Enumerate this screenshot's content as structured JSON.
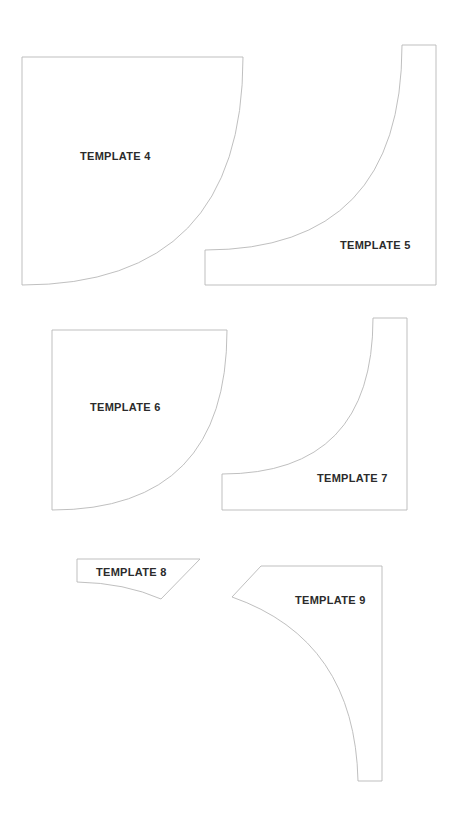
{
  "templates": [
    {
      "id": "4",
      "label": "TEMPLATE 4",
      "shape": "quarter-circle"
    },
    {
      "id": "5",
      "label": "TEMPLATE 5",
      "shape": "concave-corner"
    },
    {
      "id": "6",
      "label": "TEMPLATE 6",
      "shape": "quarter-circle"
    },
    {
      "id": "7",
      "label": "TEMPLATE 7",
      "shape": "concave-corner"
    },
    {
      "id": "8",
      "label": "TEMPLATE 8",
      "shape": "trapezoid-curved"
    },
    {
      "id": "9",
      "label": "TEMPLATE 9",
      "shape": "curved-wedge"
    }
  ],
  "colors": {
    "outline": "#b8b8b8",
    "text": "#2b2b2b",
    "background": "#ffffff"
  }
}
